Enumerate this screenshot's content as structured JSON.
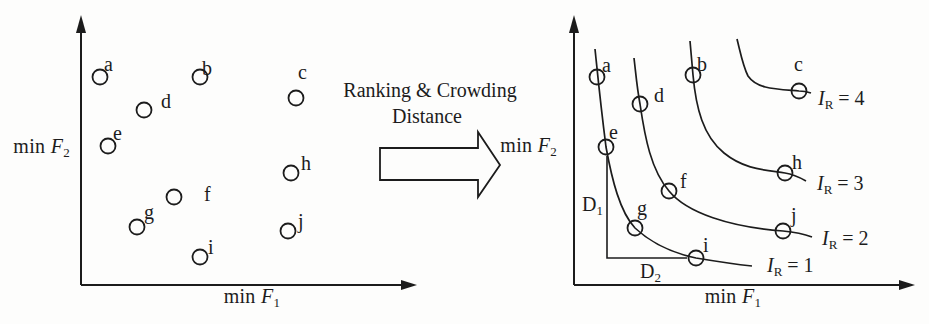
{
  "colors": {
    "ink": "#1c1c1c",
    "background": "#fdfdfc"
  },
  "transform_label": {
    "line1": "Ranking & Crowding",
    "line2": "Distance"
  },
  "left_plot": {
    "xlabel": {
      "prefix": "min ",
      "symbol": "F",
      "sub": "1"
    },
    "ylabel": {
      "prefix": "min ",
      "symbol": "F",
      "sub": "2"
    },
    "points": [
      {
        "label": "a",
        "x": 100,
        "y": 77,
        "lx": 104,
        "ly": 71
      },
      {
        "label": "b",
        "x": 200,
        "y": 77,
        "lx": 202,
        "ly": 75
      },
      {
        "label": "c",
        "x": 296,
        "y": 98,
        "lx": 298,
        "ly": 79
      },
      {
        "label": "d",
        "x": 144,
        "y": 110,
        "lx": 161,
        "ly": 108
      },
      {
        "label": "e",
        "x": 108,
        "y": 146,
        "lx": 113,
        "ly": 140
      },
      {
        "label": "f",
        "x": 174,
        "y": 197,
        "lx": 204,
        "ly": 201
      },
      {
        "label": "g",
        "x": 137,
        "y": 227,
        "lx": 144,
        "ly": 219
      },
      {
        "label": "h",
        "x": 291,
        "y": 173,
        "lx": 301,
        "ly": 170
      },
      {
        "label": "i",
        "x": 200,
        "y": 257,
        "lx": 208,
        "ly": 254
      },
      {
        "label": "j",
        "x": 288,
        "y": 231,
        "lx": 298,
        "ly": 228
      }
    ]
  },
  "right_plot": {
    "xlabel": {
      "prefix": "min ",
      "symbol": "F",
      "sub": "1"
    },
    "ylabel": {
      "prefix": "min ",
      "symbol": "F",
      "sub": "2"
    },
    "points": [
      {
        "label": "a",
        "x": 597,
        "y": 77,
        "lx": 602,
        "ly": 72
      },
      {
        "label": "b",
        "x": 693,
        "y": 75,
        "lx": 697,
        "ly": 71
      },
      {
        "label": "c",
        "x": 799,
        "y": 91,
        "lx": 794,
        "ly": 71
      },
      {
        "label": "d",
        "x": 640,
        "y": 104,
        "lx": 654,
        "ly": 102
      },
      {
        "label": "e",
        "x": 606,
        "y": 147,
        "lx": 609,
        "ly": 139
      },
      {
        "label": "f",
        "x": 669,
        "y": 191,
        "lx": 680,
        "ly": 188
      },
      {
        "label": "g",
        "x": 635,
        "y": 228,
        "lx": 637,
        "ly": 215
      },
      {
        "label": "h",
        "x": 785,
        "y": 173,
        "lx": 792,
        "ly": 169
      },
      {
        "label": "i",
        "x": 696,
        "y": 258,
        "lx": 703,
        "ly": 252
      },
      {
        "label": "j",
        "x": 783,
        "y": 231,
        "lx": 791,
        "ly": 222
      }
    ],
    "fronts": [
      {
        "rank": 1,
        "symbol": "I",
        "sub": "R",
        "eq": " = 1",
        "members": [
          "a",
          "e",
          "g",
          "i"
        ]
      },
      {
        "rank": 2,
        "symbol": "I",
        "sub": "R",
        "eq": " = 2",
        "members": [
          "d",
          "f",
          "j"
        ]
      },
      {
        "rank": 3,
        "symbol": "I",
        "sub": "R",
        "eq": " = 3",
        "members": [
          "b",
          "h"
        ]
      },
      {
        "rank": 4,
        "symbol": "I",
        "sub": "R",
        "eq": " = 4",
        "members": [
          "c"
        ]
      }
    ],
    "crowding": {
      "d1": {
        "text": "D",
        "sub": "1"
      },
      "d2": {
        "text": "D",
        "sub": "2"
      }
    }
  }
}
